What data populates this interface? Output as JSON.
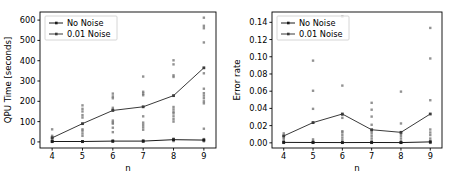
{
  "figure": {
    "background": "#ffffff",
    "panel_count": 2
  },
  "colors": {
    "no_noise": "#1a1a1a",
    "noise_001": "#3a3a3a",
    "scatter": "#6e6e6e",
    "axis": "#000000",
    "legend_border": "#cccccc"
  },
  "chart_data": [
    {
      "type": "line",
      "panel": "left",
      "title": "",
      "xlabel": "n",
      "ylabel": "QPU Time [seconds]",
      "x": [
        4,
        5,
        6,
        7,
        8,
        9
      ],
      "xticks": [
        "4",
        "5",
        "6",
        "7",
        "8",
        "9"
      ],
      "yticks": [
        "0",
        "100",
        "200",
        "300",
        "400",
        "500",
        "600"
      ],
      "ytickvalues": [
        0,
        100,
        200,
        300,
        400,
        500,
        600
      ],
      "xlim": [
        3.6,
        9.4
      ],
      "ylim": [
        -30,
        640
      ],
      "grid": false,
      "legend_position": "upper left",
      "series": [
        {
          "name": "No Noise",
          "marker": "line-with-dot",
          "values": [
            2,
            2,
            4,
            4,
            11,
            9
          ]
        },
        {
          "name": "0.01 Noise",
          "marker": "line-with-dot",
          "values": [
            20,
            90,
            155,
            173,
            228,
            365
          ]
        }
      ],
      "scatter": {
        "no_noise": [
          {
            "x": 4,
            "y": [
              0,
              1,
              2,
              3,
              4
            ]
          },
          {
            "x": 5,
            "y": [
              0,
              1,
              2,
              3
            ]
          },
          {
            "x": 6,
            "y": [
              1,
              2,
              4,
              6
            ]
          },
          {
            "x": 7,
            "y": [
              1,
              2,
              4,
              7
            ]
          },
          {
            "x": 8,
            "y": [
              4,
              8,
              12,
              16
            ]
          },
          {
            "x": 9,
            "y": [
              3,
              7,
              10,
              14
            ]
          }
        ],
        "noise_001": [
          {
            "x": 4,
            "y": [
              6,
              12,
              18,
              24,
              30,
              62
            ]
          },
          {
            "x": 5,
            "y": [
              30,
              42,
              55,
              62,
              120,
              132,
              150,
              163,
              180
            ]
          },
          {
            "x": 6,
            "y": [
              48,
              70,
              90,
              96,
              105,
              160,
              168,
              215,
              224,
              238
            ]
          },
          {
            "x": 7,
            "y": [
              60,
              72,
              84,
              95,
              126,
              230,
              238,
              247,
              322
            ]
          },
          {
            "x": 8,
            "y": [
              100,
              112,
              126,
              140,
              148,
              160,
              172,
              320,
              328,
              382,
              402
            ]
          },
          {
            "x": 9,
            "y": [
              65,
              190,
              200,
              215,
              228,
              240,
              262,
              338,
              490,
              560,
              572,
              612
            ]
          }
        ]
      }
    },
    {
      "type": "line",
      "panel": "right",
      "title": "",
      "xlabel": "n",
      "ylabel": "Error rate",
      "x": [
        4,
        5,
        6,
        7,
        8,
        9
      ],
      "xticks": [
        "4",
        "5",
        "6",
        "7",
        "8",
        "9"
      ],
      "yticks": [
        "0.00",
        "0.02",
        "0.04",
        "0.06",
        "0.08",
        "0.10",
        "0.12",
        "0.14"
      ],
      "ytickvalues": [
        0.0,
        0.02,
        0.04,
        0.06,
        0.08,
        0.1,
        0.12,
        0.14
      ],
      "xlim": [
        3.6,
        9.4
      ],
      "ylim": [
        -0.006,
        0.152
      ],
      "grid": false,
      "legend_position": "upper left",
      "series": [
        {
          "name": "No Noise",
          "marker": "line-with-dot",
          "values": [
            0.0005,
            0.0004,
            0.0003,
            0.0004,
            0.0003,
            0.0011
          ]
        },
        {
          "name": "0.01 Noise",
          "marker": "line-with-dot",
          "values": [
            0.008,
            0.0235,
            0.0335,
            0.0152,
            0.0122,
            0.0335
          ]
        }
      ],
      "scatter": {
        "no_noise": [
          {
            "x": 4,
            "y": [
              0.0,
              0.0005,
              0.001
            ]
          },
          {
            "x": 5,
            "y": [
              0.0,
              0.0004,
              0.0009
            ]
          },
          {
            "x": 6,
            "y": [
              0.0,
              0.0003,
              0.0007
            ]
          },
          {
            "x": 7,
            "y": [
              0.0,
              0.0004,
              0.0008
            ]
          },
          {
            "x": 8,
            "y": [
              0.0,
              0.0003,
              0.0007
            ]
          },
          {
            "x": 9,
            "y": [
              0.0,
              0.0011,
              0.0022
            ]
          }
        ],
        "noise_001": [
          {
            "x": 4,
            "y": [
              0.0,
              0.002,
              0.004,
              0.006,
              0.008,
              0.011
            ]
          },
          {
            "x": 5,
            "y": [
              0.0,
              0.002,
              0.004,
              0.0235,
              0.0395,
              0.0605,
              0.0955
            ]
          },
          {
            "x": 6,
            "y": [
              0.0,
              0.003,
              0.006,
              0.009,
              0.012,
              0.0135,
              0.029,
              0.0325,
              0.0665,
              0.1465
            ]
          },
          {
            "x": 7,
            "y": [
              0.0,
              0.002,
              0.005,
              0.008,
              0.011,
              0.0135,
              0.021,
              0.0305,
              0.0385,
              0.0465
            ]
          },
          {
            "x": 8,
            "y": [
              0.0,
              0.002,
              0.005,
              0.008,
              0.0105,
              0.0225,
              0.0595
            ]
          },
          {
            "x": 9,
            "y": [
              0.0,
              0.005,
              0.009,
              0.012,
              0.0155,
              0.0495,
              0.098,
              0.1335
            ]
          }
        ]
      }
    }
  ]
}
